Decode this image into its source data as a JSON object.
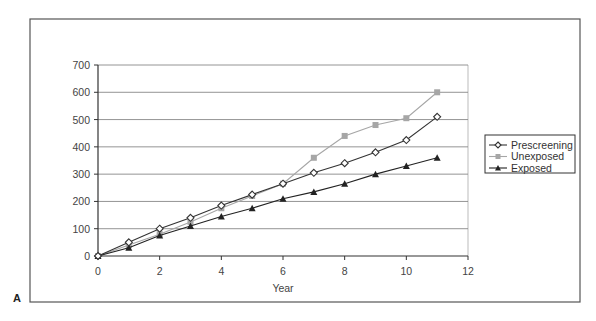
{
  "figure": {
    "panel_label": "A"
  },
  "chart_data": {
    "type": "line",
    "title": "",
    "xlabel": "Year",
    "ylabel": "",
    "xlim": [
      0,
      12
    ],
    "ylim": [
      0,
      700
    ],
    "x_ticks": [
      0,
      2,
      4,
      6,
      8,
      10,
      12
    ],
    "y_ticks": [
      0,
      100,
      200,
      300,
      400,
      500,
      600,
      700
    ],
    "grid": {
      "horizontal": true,
      "vertical": false
    },
    "legend_position": "right",
    "x": [
      0,
      1,
      2,
      3,
      4,
      5,
      6,
      7,
      8,
      9,
      10,
      11
    ],
    "series": [
      {
        "name": "Prescreening",
        "marker": "diamond-open",
        "color": "#333333",
        "values": [
          0,
          50,
          100,
          140,
          185,
          225,
          265,
          305,
          340,
          380,
          425,
          510
        ]
      },
      {
        "name": "Unexposed",
        "marker": "square",
        "color": "#a6a6a6",
        "values": [
          0,
          40,
          80,
          125,
          175,
          220,
          265,
          360,
          440,
          480,
          505,
          600
        ]
      },
      {
        "name": "Exposed",
        "marker": "triangle",
        "color": "#222222",
        "values": [
          0,
          30,
          75,
          110,
          145,
          175,
          210,
          235,
          265,
          300,
          330,
          360
        ]
      }
    ]
  }
}
